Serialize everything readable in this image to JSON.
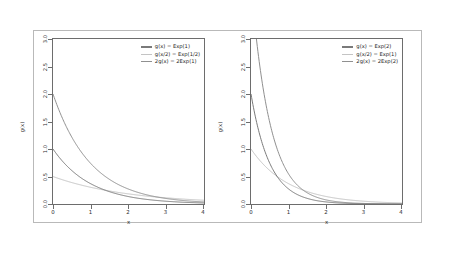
{
  "figure": {
    "background": "#ffffff",
    "frame_color": "#b9b9b9",
    "axis_color": "#6d6d6d"
  },
  "panels": [
    {
      "id": "left",
      "xlabel": "x",
      "ylabel": "g(x)",
      "xlim": [
        0,
        4
      ],
      "ylim": [
        0,
        3
      ],
      "xticks": [
        "0",
        "1",
        "2",
        "3",
        "4"
      ],
      "xtick_values": [
        0,
        1,
        2,
        3,
        4
      ],
      "yticks": [
        "0.0",
        "0.5",
        "1.0",
        "1.5",
        "2.0",
        "2.5",
        "3.0"
      ],
      "ytick_values": [
        0.0,
        0.5,
        1.0,
        1.5,
        2.0,
        2.5,
        3.0
      ],
      "legend": [
        {
          "label": "g(x) = Exp(1)",
          "color": "#7a7a7a"
        },
        {
          "label": "g(x/2) = Exp(1/2)",
          "color": "#c4c4c4"
        },
        {
          "label": "2g(x) = 2Exp(1)",
          "color": "#909090"
        }
      ]
    },
    {
      "id": "right",
      "xlabel": "x",
      "ylabel": "g(x)",
      "xlim": [
        0,
        4
      ],
      "ylim": [
        0,
        3
      ],
      "xticks": [
        "0",
        "1",
        "2",
        "3",
        "4"
      ],
      "xtick_values": [
        0,
        1,
        2,
        3,
        4
      ],
      "yticks": [
        "0.0",
        "0.5",
        "1.0",
        "1.5",
        "2.0",
        "2.5",
        "3.0"
      ],
      "ytick_values": [
        0.0,
        0.5,
        1.0,
        1.5,
        2.0,
        2.5,
        3.0
      ],
      "legend": [
        {
          "label": "g(x) = Exp(2)",
          "color": "#7a7a7a"
        },
        {
          "label": "g(x/2) = Exp(1)",
          "color": "#c4c4c4"
        },
        {
          "label": "2g(x) = 2Exp(2)",
          "color": "#909090"
        }
      ]
    }
  ],
  "chart_data": [
    {
      "type": "line",
      "title": "",
      "panel": "left",
      "xlabel": "x",
      "ylabel": "g(x)",
      "xlim": [
        0,
        4
      ],
      "ylim": [
        0,
        3
      ],
      "grid": false,
      "legend_position": "top-right",
      "x": [
        0,
        0.25,
        0.5,
        0.75,
        1,
        1.25,
        1.5,
        1.75,
        2,
        2.25,
        2.5,
        2.75,
        3,
        3.25,
        3.5,
        3.75,
        4
      ],
      "series": [
        {
          "name": "g(x) = Exp(1)",
          "color": "#7a7a7a",
          "formula": "exp(-x)",
          "values": [
            1.0,
            0.779,
            0.607,
            0.472,
            0.368,
            0.287,
            0.223,
            0.174,
            0.135,
            0.105,
            0.082,
            0.064,
            0.05,
            0.039,
            0.03,
            0.024,
            0.018
          ]
        },
        {
          "name": "g(x/2) = Exp(1/2)",
          "color": "#c4c4c4",
          "formula": "0.5*exp(-x/2)",
          "values": [
            0.5,
            0.441,
            0.389,
            0.344,
            0.303,
            0.268,
            0.236,
            0.208,
            0.184,
            0.162,
            0.143,
            0.126,
            0.112,
            0.099,
            0.087,
            0.077,
            0.068
          ]
        },
        {
          "name": "2g(x) = 2Exp(1)",
          "color": "#909090",
          "formula": "2*exp(-x)",
          "values": [
            2.0,
            1.558,
            1.213,
            0.945,
            0.736,
            0.573,
            0.446,
            0.347,
            0.271,
            0.211,
            0.164,
            0.128,
            0.1,
            0.078,
            0.06,
            0.047,
            0.037
          ]
        }
      ]
    },
    {
      "type": "line",
      "title": "",
      "panel": "right",
      "xlabel": "x",
      "ylabel": "g(x)",
      "xlim": [
        0,
        4
      ],
      "ylim": [
        0,
        3
      ],
      "grid": false,
      "legend_position": "top-right",
      "x": [
        0,
        0.25,
        0.5,
        0.75,
        1,
        1.25,
        1.5,
        1.75,
        2,
        2.25,
        2.5,
        2.75,
        3,
        3.25,
        3.5,
        3.75,
        4
      ],
      "series": [
        {
          "name": "g(x) = Exp(2)",
          "color": "#7a7a7a",
          "formula": "2*exp(-2x)",
          "values": [
            2.0,
            1.213,
            0.736,
            0.446,
            0.271,
            0.164,
            0.1,
            0.06,
            0.037,
            0.022,
            0.013,
            0.008,
            0.005,
            0.003,
            0.002,
            0.001,
            0.001
          ]
        },
        {
          "name": "g(x/2) = Exp(1)",
          "color": "#c4c4c4",
          "formula": "exp(-x)",
          "values": [
            1.0,
            0.779,
            0.607,
            0.472,
            0.368,
            0.287,
            0.223,
            0.174,
            0.135,
            0.105,
            0.082,
            0.064,
            0.05,
            0.039,
            0.03,
            0.024,
            0.018
          ]
        },
        {
          "name": "2g(x) = 2Exp(2)",
          "color": "#909090",
          "formula": "4*exp(-2x)",
          "values": [
            4.0,
            2.426,
            1.472,
            0.893,
            0.541,
            0.328,
            0.199,
            0.121,
            0.073,
            0.044,
            0.027,
            0.016,
            0.01,
            0.006,
            0.004,
            0.002,
            0.001
          ]
        }
      ]
    }
  ]
}
